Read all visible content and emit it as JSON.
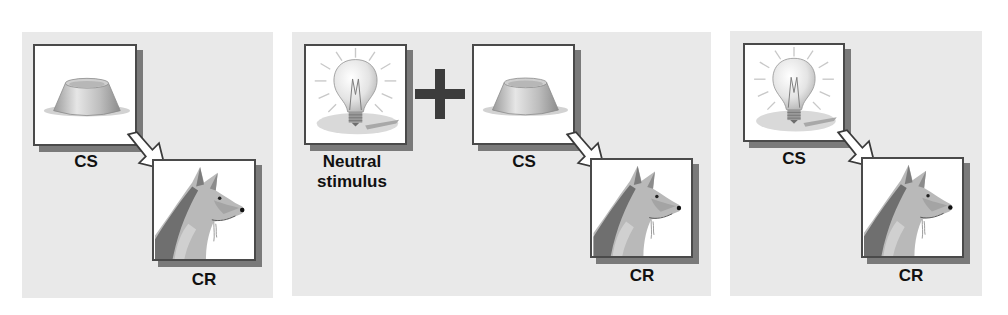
{
  "panels": [
    {
      "id": "panel-1",
      "stimulus_label": "CS",
      "stimulus_icon": "food-bowl-icon",
      "response_label": "CR",
      "response_icon": "salivating-dog-icon"
    },
    {
      "id": "panel-2",
      "neutral_label_line1": "Neutral",
      "neutral_label_line2": "stimulus",
      "neutral_icon": "light-bulb-icon",
      "operator": "plus-icon",
      "stimulus_label": "CS",
      "stimulus_icon": "food-bowl-icon",
      "response_label": "CR",
      "response_icon": "salivating-dog-icon"
    },
    {
      "id": "panel-3",
      "stimulus_label": "CS",
      "stimulus_icon": "light-bulb-icon",
      "response_label": "CR",
      "response_icon": "salivating-dog-icon"
    }
  ],
  "colors": {
    "panel_bg": "#e9e9e9",
    "box_border": "#4a4a4a",
    "box_shadow": "#7a7a7a",
    "plus": "#3c3c3c",
    "text": "#111111"
  }
}
